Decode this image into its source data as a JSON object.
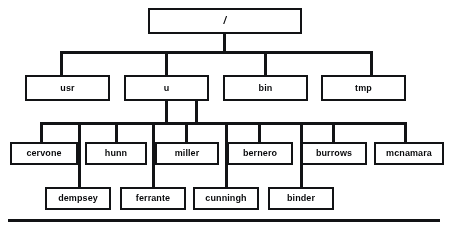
{
  "diagram": {
    "type": "tree",
    "colors": {
      "line": "#17181a",
      "box_fill": "#ffffff",
      "background": "#ffffff"
    },
    "levels": [
      {
        "level": 1,
        "nodes": [
          {
            "label": "/",
            "x": 148,
            "y": 8,
            "w": 154,
            "h": 26
          }
        ]
      },
      {
        "level": 2,
        "nodes": [
          {
            "label": "usr",
            "x": 25,
            "y": 75,
            "w": 85,
            "h": 26
          },
          {
            "label": "u",
            "x": 124,
            "y": 75,
            "w": 85,
            "h": 26
          },
          {
            "label": "bin",
            "x": 223,
            "y": 75,
            "w": 85,
            "h": 26
          },
          {
            "label": "tmp",
            "x": 321,
            "y": 75,
            "w": 85,
            "h": 26
          }
        ]
      },
      {
        "level": 3,
        "nodes": [
          {
            "label": "cervone",
            "x": 10,
            "y": 142,
            "w": 68,
            "h": 23
          },
          {
            "label": "hunn",
            "x": 85,
            "y": 142,
            "w": 62,
            "h": 23
          },
          {
            "label": "miller",
            "x": 155,
            "y": 142,
            "w": 64,
            "h": 23
          },
          {
            "label": "bernero",
            "x": 227,
            "y": 142,
            "w": 66,
            "h": 23
          },
          {
            "label": "burrows",
            "x": 301,
            "y": 142,
            "w": 66,
            "h": 23
          },
          {
            "label": "mcnamara",
            "x": 374,
            "y": 142,
            "w": 70,
            "h": 23
          }
        ]
      },
      {
        "level": 4,
        "nodes": [
          {
            "label": "dempsey",
            "x": 45,
            "y": 187,
            "w": 66,
            "h": 23
          },
          {
            "label": "ferrante",
            "x": 120,
            "y": 187,
            "w": 66,
            "h": 23
          },
          {
            "label": "cunningh",
            "x": 193,
            "y": 187,
            "w": 66,
            "h": 23
          },
          {
            "label": "binder",
            "x": 268,
            "y": 187,
            "w": 66,
            "h": 23
          }
        ]
      }
    ],
    "connectors": {
      "root_stem": {
        "x": 223,
        "y": 34,
        "h": 18
      },
      "bus_level2": {
        "x": 60,
        "y": 51,
        "w": 312
      },
      "bus_level2_drops": [
        {
          "x": 60,
          "y": 51,
          "h": 24
        },
        {
          "x": 165,
          "y": 51,
          "h": 24
        },
        {
          "x": 264,
          "y": 51,
          "h": 24
        },
        {
          "x": 370,
          "y": 51,
          "h": 24
        }
      ],
      "u_stems": [
        {
          "x": 165,
          "y": 101,
          "h": 22
        },
        {
          "x": 195,
          "y": 101,
          "h": 22
        }
      ],
      "bus_level3": {
        "x": 40,
        "y": 122,
        "w": 364
      },
      "bus_level3_drops": [
        {
          "x": 40,
          "y": 122,
          "h": 20
        },
        {
          "x": 115,
          "y": 122,
          "h": 20
        },
        {
          "x": 185,
          "y": 122,
          "h": 20
        },
        {
          "x": 258,
          "y": 122,
          "h": 20
        },
        {
          "x": 332,
          "y": 122,
          "h": 20
        },
        {
          "x": 404,
          "y": 122,
          "h": 20
        }
      ],
      "bus_level4_drops": [
        {
          "x": 78,
          "y": 122,
          "h": 65
        },
        {
          "x": 152,
          "y": 122,
          "h": 65
        },
        {
          "x": 225,
          "y": 122,
          "h": 65
        },
        {
          "x": 300,
          "y": 122,
          "h": 65
        }
      ]
    },
    "baseline_rule": {
      "x": 8,
      "y": 219,
      "w": 432
    }
  }
}
